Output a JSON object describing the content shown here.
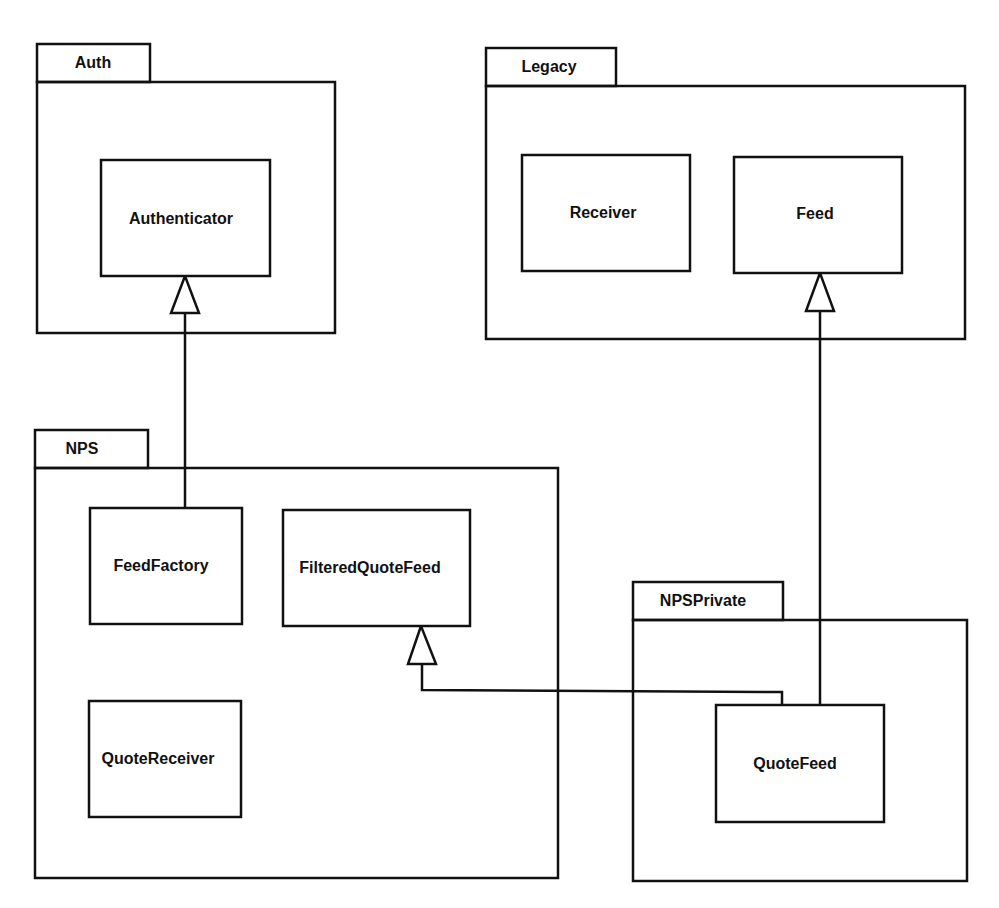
{
  "diagram": {
    "type": "UML package diagram",
    "stroke_color": "#111111",
    "background": "#ffffff"
  },
  "packages": [
    {
      "id": "auth",
      "name": "Auth",
      "tab": {
        "x": 37,
        "y": 44,
        "w": 113,
        "h": 38
      },
      "body": {
        "x": 37,
        "y": 82,
        "w": 298,
        "h": 251
      }
    },
    {
      "id": "legacy",
      "name": "Legacy",
      "tab": {
        "x": 486,
        "y": 48,
        "w": 130,
        "h": 38
      },
      "body": {
        "x": 486,
        "y": 86,
        "w": 479,
        "h": 253
      }
    },
    {
      "id": "nps",
      "name": "NPS",
      "tab": {
        "x": 35,
        "y": 430,
        "w": 113,
        "h": 38
      },
      "body": {
        "x": 35,
        "y": 468,
        "w": 523,
        "h": 410
      }
    },
    {
      "id": "npsprivate",
      "name": "NPSPrivate",
      "tab": {
        "x": 633,
        "y": 582,
        "w": 150,
        "h": 38
      },
      "body": {
        "x": 633,
        "y": 620,
        "w": 334,
        "h": 261
      }
    }
  ],
  "classes": [
    {
      "id": "authenticator",
      "name": "Authenticator",
      "package": "Auth",
      "x": 101,
      "y": 160,
      "w": 169,
      "h": 116
    },
    {
      "id": "receiver",
      "name": "Receiver",
      "package": "Legacy",
      "x": 522,
      "y": 155,
      "w": 168,
      "h": 116
    },
    {
      "id": "feed",
      "name": "Feed",
      "package": "Legacy",
      "x": 734,
      "y": 157,
      "w": 168,
      "h": 116
    },
    {
      "id": "feedfactory",
      "name": "FeedFactory",
      "package": "NPS",
      "x": 90,
      "y": 508,
      "w": 152,
      "h": 116
    },
    {
      "id": "filteredquotefeed",
      "name": "FilteredQuoteFeed",
      "package": "NPS",
      "x": 283,
      "y": 510,
      "w": 187,
      "h": 116
    },
    {
      "id": "quotereceiver",
      "name": "QuoteReceiver",
      "package": "NPS",
      "x": 89,
      "y": 701,
      "w": 152,
      "h": 116
    },
    {
      "id": "quotefeed",
      "name": "QuoteFeed",
      "package": "NPSPrivate",
      "x": 716,
      "y": 705,
      "w": 168,
      "h": 117
    }
  ],
  "relationships": [
    {
      "type": "generalization",
      "from": "FeedFactory",
      "to": "Authenticator",
      "points": [
        [
          185,
          508
        ],
        [
          185,
          313
        ]
      ],
      "tip": [
        185,
        276
      ]
    },
    {
      "type": "generalization",
      "from": "QuoteFeed",
      "to": "Feed",
      "points": [
        [
          820,
          705
        ],
        [
          820,
          311
        ]
      ],
      "tip": [
        820,
        273
      ]
    },
    {
      "type": "generalization",
      "from": "QuoteFeed",
      "to": "FilteredQuoteFeed",
      "points": [
        [
          782,
          705
        ],
        [
          782,
          692
        ],
        [
          422,
          690
        ],
        [
          422,
          664
        ]
      ],
      "tip": [
        421,
        626
      ]
    }
  ]
}
